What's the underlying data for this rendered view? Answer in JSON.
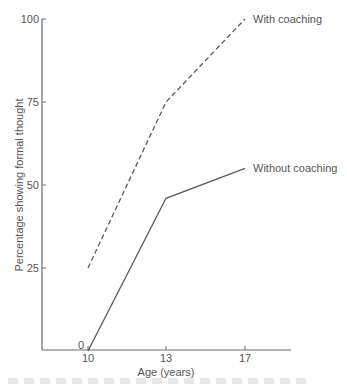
{
  "chart_data": {
    "type": "line",
    "title": "",
    "xlabel": "Age (years)",
    "ylabel": "Percentage showing formal thought",
    "x": [
      10,
      13,
      17
    ],
    "x_tick_labels": [
      "10",
      "13",
      "17"
    ],
    "y_tick_labels": [
      "0",
      "25",
      "50",
      "75",
      "100"
    ],
    "y_ticks": [
      0,
      25,
      50,
      75,
      100
    ],
    "ylim": [
      0,
      100
    ],
    "xlim": [
      8,
      19.3
    ],
    "grid": false,
    "legend_position": "inline labels at line ends",
    "series": [
      {
        "name": "With coaching",
        "style": "dashed",
        "values": [
          25,
          75,
          100
        ]
      },
      {
        "name": "Without coaching",
        "style": "solid",
        "values": [
          0,
          46,
          55
        ]
      }
    ]
  },
  "colors": {
    "axis": "#6a6a6a",
    "line": "#5a5a5a",
    "text": "#555555"
  }
}
